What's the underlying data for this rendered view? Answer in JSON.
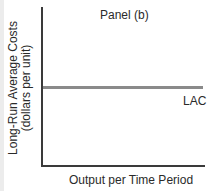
{
  "chart_data": {
    "type": "line",
    "title": "Panel (b)",
    "xlabel": "Output per Time Period",
    "ylabel": "Long-Run Average Costs (dollars per unit)",
    "ylabel_lines": [
      "Long-Run Average Costs",
      "(dollars per unit)"
    ],
    "series": [
      {
        "name": "LAC",
        "x": [
          0,
          1
        ],
        "values": [
          0.5,
          0.5
        ],
        "color": "#8a8a8a"
      }
    ],
    "grid": false,
    "legend": "inline label at right end of line",
    "xticks": [],
    "yticks": []
  }
}
